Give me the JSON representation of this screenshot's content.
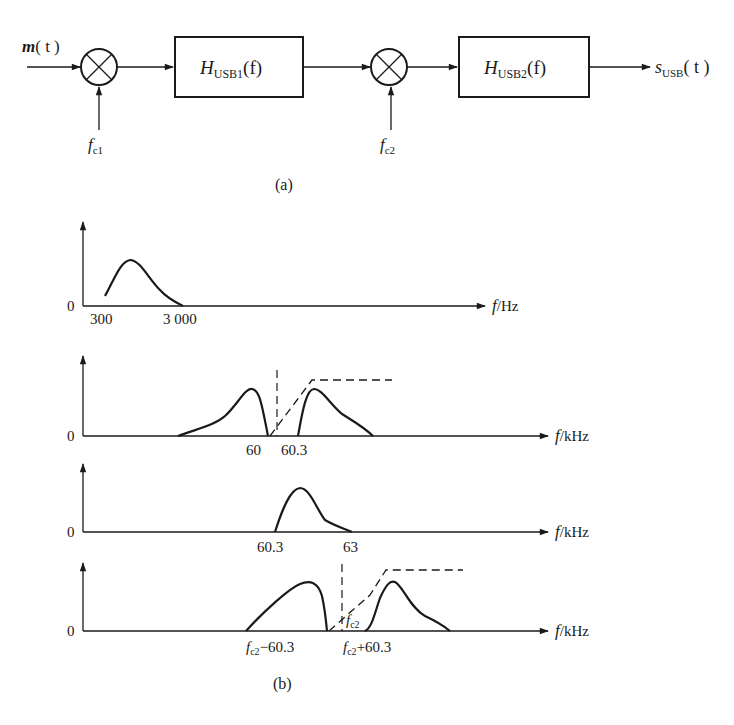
{
  "block_diagram": {
    "input_label": "m(t)",
    "input_m": "m",
    "input_t": "( t )",
    "mixer1_lo": {
      "base": "f",
      "sub": "c1"
    },
    "filter1": {
      "base": "H",
      "sub": "USB1",
      "arg": "(f)"
    },
    "mixer2_lo": {
      "base": "f",
      "sub": "c2"
    },
    "filter2": {
      "base": "H",
      "sub": "USB2",
      "arg": "(f)"
    },
    "output": {
      "base": "s",
      "sub": "USB",
      "arg": "( t )"
    },
    "caption": "(a)"
  },
  "spectra": {
    "caption": "(b)",
    "plots": [
      {
        "zero": "0",
        "axis_label_f": "f",
        "axis_unit": "/Hz",
        "ticks": [
          "300",
          "3 000"
        ]
      },
      {
        "zero": "0",
        "axis_label_f": "f",
        "axis_unit": "/kHz",
        "ticks": [
          "60",
          "60.3"
        ]
      },
      {
        "zero": "0",
        "axis_label_f": "f",
        "axis_unit": "/kHz",
        "ticks": [
          "60.3",
          "63"
        ]
      },
      {
        "zero": "0",
        "axis_label_f": "f",
        "axis_unit": "/kHz",
        "ticks": [
          {
            "base": "f",
            "sub": "c2",
            "suffix": "−60.3"
          },
          {
            "base": "f",
            "sub": "c2",
            "suffix": "+60.3"
          }
        ],
        "center_label": {
          "base": "f",
          "sub": "c2"
        }
      }
    ]
  }
}
